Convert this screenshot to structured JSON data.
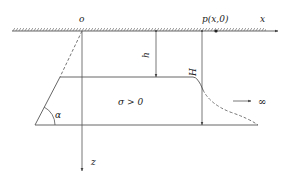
{
  "diagram": {
    "labels": {
      "origin": "o",
      "point": "p(x,0)",
      "x_axis": "x",
      "z_axis": "z",
      "depth_top": "h",
      "depth_bottom": "H",
      "region": "σ > 0",
      "angle": "α",
      "infinity": "∞"
    },
    "colors": {
      "line": "#555555",
      "text": "#222222",
      "background": "#ffffff"
    }
  }
}
